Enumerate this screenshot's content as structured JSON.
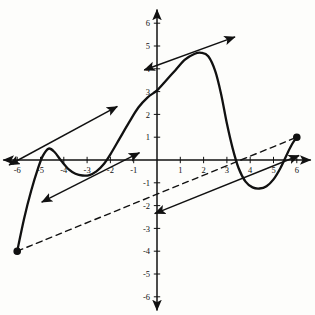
{
  "figure": {
    "title": "",
    "background": "#fdfdfb",
    "ink_color": "#111111"
  },
  "axes": {
    "x_label": "",
    "y_label": "",
    "xlim": [
      -6.6,
      6.6
    ],
    "ylim": [
      -6.6,
      6.6
    ],
    "grid": false,
    "origin_px": [
      157,
      160
    ],
    "unit_px_x": 23.3,
    "unit_px_y": 22.8,
    "x_ticks": [
      -6,
      -5,
      -4,
      -3,
      -2,
      -1,
      1,
      2,
      3,
      4,
      5,
      6
    ],
    "x_tick_labels": [
      "-6",
      "-5",
      "-4",
      "-3",
      "-2",
      "-1",
      "1",
      "2",
      "3",
      "4",
      "5",
      "6"
    ],
    "y_ticks": [
      6,
      5,
      4,
      3,
      2,
      1,
      -1,
      -2,
      -3,
      -4,
      -5,
      -6
    ],
    "y_tick_labels": [
      "6",
      "5",
      "4",
      "3",
      "2",
      "1",
      "-1",
      "-2",
      "-3",
      "-4",
      "-5",
      "-6"
    ],
    "x_axis_arrows": [
      "left",
      "right"
    ],
    "y_axis_arrows": [
      "up",
      "down"
    ]
  },
  "chart_data": {
    "type": "line",
    "title": "",
    "xlabel": "",
    "ylabel": "",
    "xlim": [
      -6.6,
      6.6
    ],
    "ylim": [
      -6.6,
      6.6
    ],
    "grid": false,
    "legend": "none",
    "series": [
      {
        "name": "curve",
        "style": "solid",
        "endpoints_marker": "filled-dot",
        "x": [
          -6.0,
          -5.7,
          -5.4,
          -5.1,
          -4.9,
          -4.65,
          -4.4,
          -4.1,
          -3.8,
          -3.5,
          -3.2,
          -2.9,
          -2.6,
          -2.3,
          -2.0,
          -1.6,
          -1.2,
          -0.8,
          -0.4,
          0.0,
          0.4,
          0.8,
          1.2,
          1.6,
          1.9,
          2.2,
          2.5,
          2.75,
          3.0,
          3.25,
          3.5,
          3.8,
          4.1,
          4.4,
          4.7,
          5.0,
          5.3,
          5.6,
          5.8,
          6.0
        ],
        "y": [
          -4.0,
          -2.55,
          -1.35,
          -0.35,
          0.18,
          0.5,
          0.35,
          -0.05,
          -0.4,
          -0.6,
          -0.68,
          -0.66,
          -0.5,
          -0.2,
          0.25,
          0.95,
          1.65,
          2.3,
          2.75,
          3.05,
          3.5,
          3.95,
          4.4,
          4.65,
          4.7,
          4.55,
          3.9,
          2.9,
          1.6,
          0.5,
          -0.35,
          -0.95,
          -1.2,
          -1.25,
          -1.15,
          -0.85,
          -0.35,
          0.3,
          0.7,
          1.0
        ]
      },
      {
        "name": "secant-line",
        "style": "dashed",
        "description": "secant through the two curve endpoints",
        "x": [
          -6.0,
          6.0
        ],
        "y": [
          -4.0,
          1.0
        ],
        "slope": 0.4167
      }
    ],
    "annotations": [
      {
        "name": "tangent-at-left-max",
        "style": "solid-arrow",
        "arrows": [
          "start",
          "end"
        ],
        "x": [
          -6.35,
          -1.7
        ],
        "y": [
          -0.22,
          2.35
        ],
        "slope": 0.5529,
        "tangent_point": [
          -4.65,
          0.5
        ]
      },
      {
        "name": "tangent-at-left-inflection",
        "style": "solid-arrow",
        "arrows": [
          "start",
          "end"
        ],
        "x": [
          -4.95,
          -0.75
        ],
        "y": [
          -1.85,
          0.32
        ],
        "slope": 0.5167,
        "tangent_point": [
          -2.9,
          -0.77
        ]
      },
      {
        "name": "tangent-at-right-max",
        "style": "solid-arrow",
        "arrows": [
          "start",
          "end"
        ],
        "x": [
          -0.55,
          3.35
        ],
        "y": [
          3.95,
          5.4
        ],
        "slope": 0.3718,
        "tangent_point": [
          1.6,
          4.75
        ]
      },
      {
        "name": "tangent-at-right-min",
        "style": "solid-arrow",
        "arrows": [
          "start",
          "end"
        ],
        "x": [
          -0.1,
          6.1
        ],
        "y": [
          -2.35,
          0.2
        ],
        "slope": 0.4113,
        "tangent_point": [
          4.35,
          -1.25
        ]
      }
    ],
    "markers": [
      {
        "name": "left-endpoint",
        "x": -6.0,
        "y": -4.0,
        "filled": true
      },
      {
        "name": "right-endpoint",
        "x": 6.0,
        "y": 1.0,
        "filled": true
      }
    ]
  }
}
